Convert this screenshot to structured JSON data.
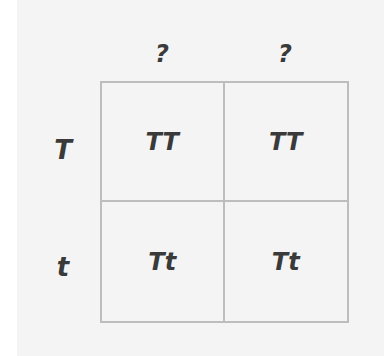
{
  "diagram": {
    "type": "punnett-square",
    "column_headers": [
      "?",
      "?"
    ],
    "row_headers": [
      "T",
      "t"
    ],
    "cells": [
      [
        "TT",
        "TT"
      ],
      [
        "Tt",
        "Tt"
      ]
    ],
    "colors": {
      "background": "#f4f4f4",
      "grid_line": "#bdbdbd",
      "text": "#3a3a3a"
    }
  }
}
